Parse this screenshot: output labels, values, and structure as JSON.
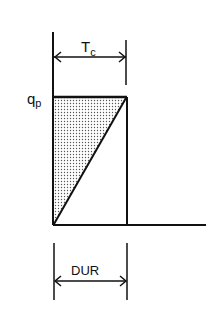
{
  "diagram": {
    "title_label": "T",
    "title_subscript": "c",
    "peak_label": "q",
    "peak_subscript": "p",
    "duration_label": "DUR",
    "colors": {
      "ink": "#111111",
      "fill_dots": "#555555",
      "background": "#ffffff"
    }
  }
}
